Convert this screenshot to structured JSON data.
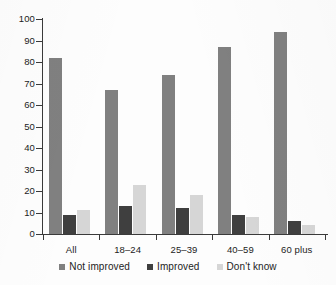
{
  "chart_data": {
    "type": "bar",
    "title": "",
    "subtitle": "",
    "xlabel": "",
    "ylabel": "",
    "categories": [
      "All",
      "18–24",
      "25–39",
      "40–59",
      "60 plus"
    ],
    "series": [
      {
        "name": "Not improved",
        "color": "#808080",
        "values": [
          82,
          67,
          74,
          87,
          94
        ]
      },
      {
        "name": "Improved",
        "color": "#3f3f3f",
        "values": [
          9,
          13,
          12,
          9,
          6
        ]
      },
      {
        "name": "Don't know",
        "color": "#d6d6d6",
        "values": [
          11,
          23,
          18,
          8,
          4
        ]
      }
    ],
    "ylim": [
      0,
      100
    ],
    "ytick_values": [
      0,
      10,
      20,
      30,
      40,
      50,
      60,
      70,
      80,
      90,
      100
    ],
    "ytick_labels": [
      "0",
      "10",
      "20",
      "30",
      "40",
      "50",
      "60",
      "70",
      "80",
      "90",
      "100"
    ],
    "grid": false,
    "legend_position": "bottom",
    "axis_color": "#3a3a3a",
    "background": "#ffffff"
  },
  "legend": {
    "items": [
      {
        "label": "Not improved"
      },
      {
        "label": "Improved"
      },
      {
        "label": "Don't know"
      }
    ]
  }
}
